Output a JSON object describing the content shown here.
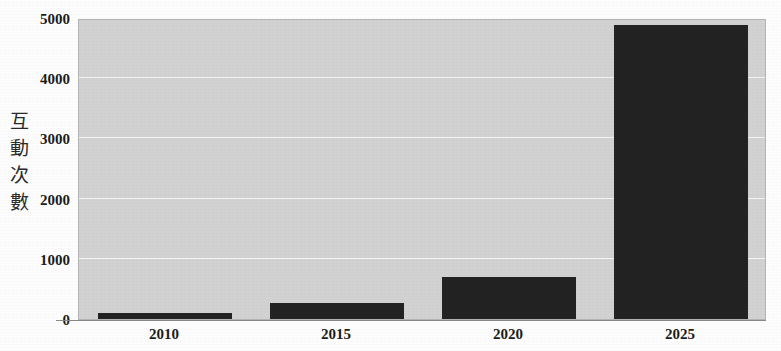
{
  "chart_data": {
    "type": "bar",
    "title": "",
    "subtitle": "",
    "xlabel": "",
    "ylabel": "互動次數",
    "ylabel_chars": [
      "互",
      "動",
      "次",
      "數"
    ],
    "categories": [
      "2010",
      "2015",
      "2020",
      "2025"
    ],
    "values": [
      95,
      260,
      700,
      4880
    ],
    "series": [
      {
        "name": "互動次數",
        "values": [
          95,
          260,
          700,
          4880
        ]
      }
    ],
    "ylim": [
      0,
      5000
    ],
    "y_ticks": [
      0,
      1000,
      2000,
      3000,
      4000,
      5000
    ],
    "y_tick_labels": [
      "0",
      "1000",
      "2000",
      "3000",
      "4000",
      "5000"
    ],
    "grid": true,
    "grid_axis": "y",
    "legend": false,
    "legend_position": "none",
    "colors": {
      "bar": "#232323",
      "plot_background": "#d2d2d2",
      "figure_background": "#fdfdfd",
      "gridline": "#f4f4f4",
      "axis_line": "#8a8a8a",
      "text": "#1c1c1c"
    },
    "annotations": []
  }
}
